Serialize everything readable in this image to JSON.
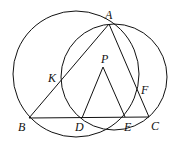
{
  "diagram": {
    "type": "geometry",
    "points": {
      "A": {
        "label": "A",
        "x": 109,
        "y": 24
      },
      "B": {
        "label": "B",
        "x": 29,
        "y": 118
      },
      "C": {
        "label": "C",
        "x": 149,
        "y": 117
      },
      "D": {
        "label": "D",
        "x": 82,
        "y": 118
      },
      "E": {
        "label": "E",
        "x": 125,
        "y": 117
      },
      "F": {
        "label": "F",
        "x": 138,
        "y": 90
      },
      "K": {
        "label": "K",
        "x": 61,
        "y": 79
      },
      "P": {
        "label": "P",
        "x": 103,
        "y": 67
      }
    },
    "circles": [
      {
        "name": "circle-ABD",
        "cx": 76,
        "cy": 74,
        "r": 63
      },
      {
        "name": "circle-AEC",
        "cx": 114,
        "cy": 77,
        "r": 53
      }
    ],
    "segments": [
      "AB",
      "AC",
      "BC",
      "PD",
      "PE"
    ]
  }
}
